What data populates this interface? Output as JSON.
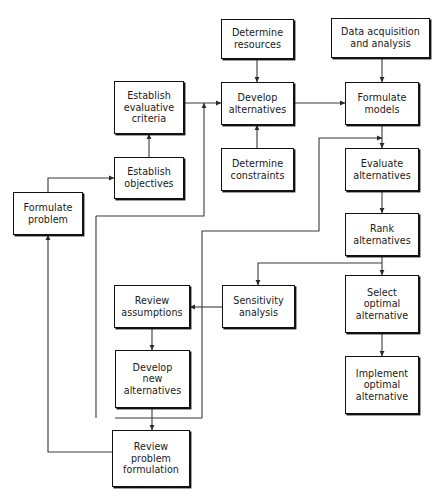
{
  "diagram": {
    "type": "flowchart",
    "canvas": {
      "width": 437,
      "height": 497
    },
    "style": {
      "box_fill": "#ffffff",
      "box_stroke": "#111111",
      "edge_stroke": "#3a3a3a",
      "text_color": "#1a1a1a",
      "background": "#ffffff"
    },
    "nodes": [
      {
        "id": "determine_resources",
        "label": "Determine\nresources",
        "x": 221,
        "y": 19,
        "w": 73,
        "h": 40
      },
      {
        "id": "data_acquisition",
        "label": "Data acquisition\nand analysis",
        "x": 331,
        "y": 18,
        "w": 99,
        "h": 40
      },
      {
        "id": "establish_criteria",
        "label": "Establish\nevaluative\ncriteria",
        "x": 114,
        "y": 81,
        "w": 70,
        "h": 53
      },
      {
        "id": "develop_alternatives",
        "label": "Develop\nalternatives",
        "x": 221,
        "y": 82,
        "w": 73,
        "h": 43
      },
      {
        "id": "formulate_models",
        "label": "Formulate\nmodels",
        "x": 345,
        "y": 82,
        "w": 74,
        "h": 43
      },
      {
        "id": "determine_constraints",
        "label": "Determine\nconstraints",
        "x": 221,
        "y": 148,
        "w": 73,
        "h": 43
      },
      {
        "id": "evaluate_alternatives",
        "label": "Evaluate\nalternatives",
        "x": 345,
        "y": 148,
        "w": 74,
        "h": 43
      },
      {
        "id": "establish_objectives",
        "label": "Establish\nobjectives",
        "x": 114,
        "y": 157,
        "w": 70,
        "h": 42
      },
      {
        "id": "formulate_problem",
        "label": "Formulate\nproblem",
        "x": 13,
        "y": 192,
        "w": 70,
        "h": 43
      },
      {
        "id": "rank_alternatives",
        "label": "Rank\nalternatives",
        "x": 345,
        "y": 213,
        "w": 74,
        "h": 43
      },
      {
        "id": "select_optimal",
        "label": "Select\noptimal\nalternative",
        "x": 345,
        "y": 275,
        "w": 74,
        "h": 58
      },
      {
        "id": "review_assumptions",
        "label": "Review\nassumptions",
        "x": 114,
        "y": 285,
        "w": 76,
        "h": 43
      },
      {
        "id": "sensitivity_analysis",
        "label": "Sensitivity\nanalysis",
        "x": 222,
        "y": 285,
        "w": 73,
        "h": 43
      },
      {
        "id": "develop_new",
        "label": "Develop\nnew\nalternatives",
        "x": 115,
        "y": 350,
        "w": 75,
        "h": 58
      },
      {
        "id": "implement_optimal",
        "label": "Implement\noptimal\nalternative",
        "x": 345,
        "y": 356,
        "w": 74,
        "h": 58
      },
      {
        "id": "review_problem",
        "label": "Review\nproblem\nformulation",
        "x": 112,
        "y": 430,
        "w": 78,
        "h": 57
      }
    ],
    "edges": [
      {
        "id": "resources-to-develop",
        "from": "determine_resources",
        "to": "develop_alternatives",
        "points": "257,59 257,82",
        "arrow": true
      },
      {
        "id": "data-to-models",
        "from": "data_acquisition",
        "to": "formulate_models",
        "points": "382,58 382,82",
        "arrow": true
      },
      {
        "id": "criteria-to-develop",
        "from": "establish_criteria",
        "to": "develop_alternatives",
        "points": "184,103 221,103",
        "arrow": true
      },
      {
        "id": "develop-to-models",
        "from": "develop_alternatives",
        "to": "formulate_models",
        "points": "294,103 345,103",
        "arrow": true
      },
      {
        "id": "constraints-to-develop",
        "from": "determine_constraints",
        "to": "develop_alternatives",
        "points": "257,148 257,125",
        "arrow": true
      },
      {
        "id": "objectives-to-criteria",
        "from": "establish_objectives",
        "to": "establish_criteria",
        "points": "149,157 149,134",
        "arrow": true
      },
      {
        "id": "problem-to-objectives",
        "from": "formulate_problem",
        "to": "establish_objectives",
        "points": "48,192 48,178 114,178",
        "arrow": true
      },
      {
        "id": "models-to-evaluate",
        "from": "formulate_models",
        "to": "evaluate_alternatives",
        "points": "382,125 382,148",
        "arrow": true
      },
      {
        "id": "evaluate-to-rank",
        "from": "evaluate_alternatives",
        "to": "rank_alternatives",
        "points": "382,191 382,213",
        "arrow": true
      },
      {
        "id": "rank-to-select",
        "from": "rank_alternatives",
        "to": "select_optimal",
        "points": "382,256 382,275",
        "arrow": true
      },
      {
        "id": "select-to-implement",
        "from": "select_optimal",
        "to": "implement_optimal",
        "points": "382,333 382,356",
        "arrow": true
      },
      {
        "id": "rank-to-sensitivity",
        "from": "rank_alternatives",
        "to": "sensitivity_analysis",
        "points": "382,263 258,263 258,285",
        "arrow": true
      },
      {
        "id": "sensitivity-to-review-assum",
        "from": "sensitivity_analysis",
        "to": "review_assumptions",
        "points": "222,307 190,307",
        "arrow": true
      },
      {
        "id": "review-assum-to-develop-new",
        "from": "review_assumptions",
        "to": "develop_new",
        "points": "152,328 152,350",
        "arrow": true
      },
      {
        "id": "develop-new-to-review-prob",
        "from": "develop_new",
        "to": "review_problem",
        "points": "152,408 152,430",
        "arrow": true
      },
      {
        "id": "feedback-to-develop-alts",
        "from": "review_assumptions",
        "to": "develop_alternatives",
        "points": "96,216 204,216 204,103",
        "arrow": true
      },
      {
        "id": "feedback-to-evaluate",
        "from": "develop_new",
        "to": "evaluate_alternatives",
        "points": "202,418 202,231 319,231 319,138 382,138",
        "arrow": true
      },
      {
        "id": "review-prob-to-problem",
        "from": "review_problem",
        "to": "formulate_problem",
        "points": "112,452 48,452 48,235",
        "arrow": true
      },
      {
        "id": "develop-new-loop-left",
        "from": "develop_new",
        "to": "feedback-to-evaluate",
        "points": "115,418 202,418",
        "arrow": false
      },
      {
        "id": "review-assum-loop-left",
        "from": "review_assumptions",
        "to": "feedback-to-develop",
        "points": "96,216 96,418",
        "arrow": false
      }
    ]
  }
}
